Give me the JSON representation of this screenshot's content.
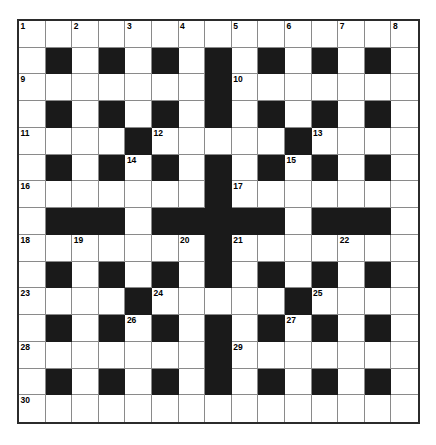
{
  "puzzle": {
    "title": "",
    "kind": "crossword-grid",
    "rows": 15,
    "cols": 15,
    "colors": {
      "block": "#1a1a1a",
      "cell": "#ffffff",
      "outer_border": "#2b2b2b",
      "inner_grid_line": "#8a8a8a",
      "number_text": "#000000",
      "page_background": "#ffffff"
    },
    "clue_number_count": 30,
    "clue_numbers_visible": [
      "1",
      "2",
      "3",
      "4",
      "5",
      "6",
      "7",
      "8",
      "9",
      "10",
      "11",
      "12",
      "13",
      "14",
      "15",
      "16",
      "17",
      "18",
      "19",
      "20",
      "21",
      "22",
      "23",
      "24",
      "25",
      "26",
      "27",
      "28",
      "29",
      "30"
    ],
    "grid": [
      [
        "0",
        "0",
        "0",
        "0",
        "0",
        "0",
        "0",
        "0",
        "0",
        "0",
        "0",
        "0",
        "0",
        "0",
        "0"
      ],
      [
        "0",
        "1",
        "0",
        "1",
        "0",
        "1",
        "0",
        "1",
        "0",
        "1",
        "0",
        "1",
        "0",
        "1",
        "0"
      ],
      [
        "0",
        "0",
        "0",
        "0",
        "0",
        "0",
        "0",
        "1",
        "0",
        "0",
        "0",
        "0",
        "0",
        "0",
        "0"
      ],
      [
        "0",
        "1",
        "0",
        "1",
        "0",
        "1",
        "0",
        "1",
        "0",
        "1",
        "0",
        "1",
        "0",
        "1",
        "0"
      ],
      [
        "0",
        "0",
        "0",
        "0",
        "1",
        "0",
        "0",
        "0",
        "0",
        "0",
        "1",
        "0",
        "0",
        "0",
        "0"
      ],
      [
        "0",
        "1",
        "0",
        "1",
        "0",
        "1",
        "0",
        "1",
        "0",
        "1",
        "0",
        "1",
        "0",
        "1",
        "0"
      ],
      [
        "0",
        "0",
        "0",
        "0",
        "0",
        "0",
        "0",
        "1",
        "0",
        "0",
        "0",
        "0",
        "0",
        "0",
        "0"
      ],
      [
        "0",
        "1",
        "1",
        "1",
        "0",
        "1",
        "1",
        "1",
        "1",
        "1",
        "0",
        "1",
        "1",
        "1",
        "0"
      ],
      [
        "0",
        "0",
        "0",
        "0",
        "0",
        "0",
        "0",
        "1",
        "0",
        "0",
        "0",
        "0",
        "0",
        "0",
        "0"
      ],
      [
        "0",
        "1",
        "0",
        "1",
        "0",
        "1",
        "0",
        "1",
        "0",
        "1",
        "0",
        "1",
        "0",
        "1",
        "0"
      ],
      [
        "0",
        "0",
        "0",
        "0",
        "1",
        "0",
        "0",
        "0",
        "0",
        "0",
        "1",
        "0",
        "0",
        "0",
        "0"
      ],
      [
        "0",
        "1",
        "0",
        "1",
        "0",
        "1",
        "0",
        "1",
        "0",
        "1",
        "0",
        "1",
        "0",
        "1",
        "0"
      ],
      [
        "0",
        "0",
        "0",
        "0",
        "0",
        "0",
        "0",
        "1",
        "0",
        "0",
        "0",
        "0",
        "0",
        "0",
        "0"
      ],
      [
        "0",
        "1",
        "0",
        "1",
        "0",
        "1",
        "0",
        "1",
        "0",
        "1",
        "0",
        "1",
        "0",
        "1",
        "0"
      ],
      [
        "0",
        "0",
        "0",
        "0",
        "0",
        "0",
        "0",
        "0",
        "0",
        "0",
        "0",
        "0",
        "0",
        "0",
        "0"
      ]
    ],
    "numbers": [
      {
        "row": 0,
        "col": 0,
        "label": "1"
      },
      {
        "row": 0,
        "col": 2,
        "label": "2"
      },
      {
        "row": 0,
        "col": 4,
        "label": "3"
      },
      {
        "row": 0,
        "col": 6,
        "label": "4"
      },
      {
        "row": 0,
        "col": 8,
        "label": "5"
      },
      {
        "row": 0,
        "col": 10,
        "label": "6"
      },
      {
        "row": 0,
        "col": 12,
        "label": "7"
      },
      {
        "row": 0,
        "col": 14,
        "label": "8"
      },
      {
        "row": 2,
        "col": 0,
        "label": "9"
      },
      {
        "row": 2,
        "col": 8,
        "label": "10"
      },
      {
        "row": 4,
        "col": 0,
        "label": "11"
      },
      {
        "row": 4,
        "col": 5,
        "label": "12"
      },
      {
        "row": 4,
        "col": 11,
        "label": "13"
      },
      {
        "row": 5,
        "col": 4,
        "label": "14"
      },
      {
        "row": 5,
        "col": 10,
        "label": "15"
      },
      {
        "row": 6,
        "col": 0,
        "label": "16"
      },
      {
        "row": 6,
        "col": 8,
        "label": "17"
      },
      {
        "row": 8,
        "col": 0,
        "label": "18"
      },
      {
        "row": 8,
        "col": 2,
        "label": "19"
      },
      {
        "row": 8,
        "col": 6,
        "label": "20"
      },
      {
        "row": 8,
        "col": 8,
        "label": "21"
      },
      {
        "row": 8,
        "col": 12,
        "label": "22"
      },
      {
        "row": 10,
        "col": 0,
        "label": "23"
      },
      {
        "row": 10,
        "col": 5,
        "label": "24"
      },
      {
        "row": 10,
        "col": 11,
        "label": "25"
      },
      {
        "row": 11,
        "col": 4,
        "label": "26"
      },
      {
        "row": 11,
        "col": 10,
        "label": "27"
      },
      {
        "row": 12,
        "col": 0,
        "label": "28"
      },
      {
        "row": 12,
        "col": 8,
        "label": "29"
      },
      {
        "row": 14,
        "col": 0,
        "label": "30"
      }
    ],
    "letters": []
  }
}
